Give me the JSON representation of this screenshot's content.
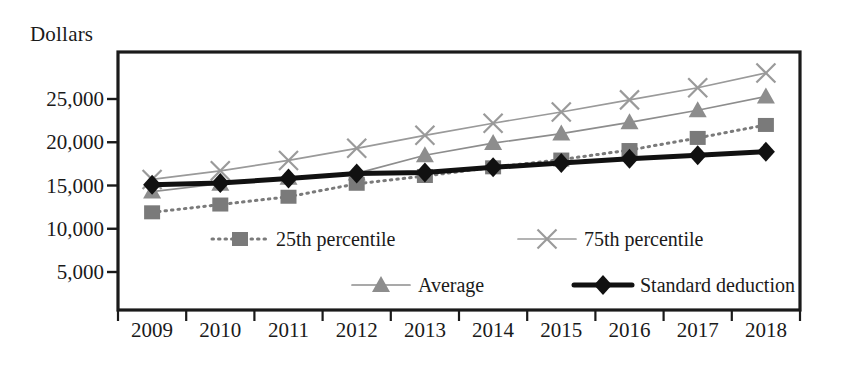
{
  "chart_data": {
    "type": "line",
    "title": "",
    "xlabel": "",
    "ylabel": "Dollars",
    "categories": [
      "2009",
      "2010",
      "2011",
      "2012",
      "2013",
      "2014",
      "2015",
      "2016",
      "2017",
      "2018"
    ],
    "ylim": [
      0,
      30000
    ],
    "yticks": [
      5000,
      10000,
      15000,
      20000,
      25000
    ],
    "ytick_labels": [
      "5,000",
      "10,000",
      "15,000",
      "20,000",
      "25,000"
    ],
    "grid": false,
    "legend_position": "inside-lower-center",
    "series": [
      {
        "name": "25th percentile",
        "marker": "square",
        "line_style": "dotted",
        "color": "#7a7a7a",
        "values": [
          11900,
          12800,
          13700,
          15200,
          16100,
          17100,
          18000,
          19100,
          20500,
          22000
        ]
      },
      {
        "name": "75th percentile",
        "marker": "cross",
        "line_style": "solid",
        "color": "#9a9a9a",
        "values": [
          15700,
          16700,
          17900,
          19300,
          20800,
          22200,
          23500,
          24900,
          26300,
          28000
        ]
      },
      {
        "name": "Average",
        "marker": "triangle",
        "line_style": "solid",
        "color": "#8d8d8d",
        "values": [
          14300,
          15200,
          15900,
          16400,
          18500,
          19900,
          21000,
          22300,
          23700,
          25300
        ]
      },
      {
        "name": "Standard deduction",
        "marker": "diamond",
        "line_style": "solid-thick",
        "color": "#111111",
        "values": [
          15100,
          15300,
          15800,
          16400,
          16500,
          17100,
          17600,
          18100,
          18500,
          18900
        ]
      }
    ]
  },
  "legend": {
    "entries": [
      {
        "label": "25th percentile",
        "series": "25th percentile"
      },
      {
        "label": "75th percentile",
        "series": "75th percentile"
      },
      {
        "label": "Average",
        "series": "Average"
      },
      {
        "label": "Standard deduction",
        "series": "Standard deduction"
      }
    ]
  },
  "colors": {
    "axis": "#1a1a1a",
    "background": "#ffffff",
    "gray_light": "#9a9a9a",
    "gray_mid": "#7a7a7a",
    "black": "#111111"
  }
}
